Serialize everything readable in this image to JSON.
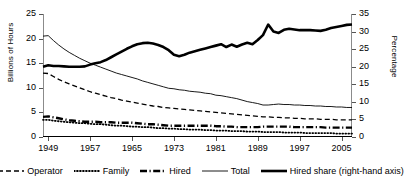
{
  "chart_data": {
    "type": "line",
    "title": "",
    "xlabel": "",
    "ylabel": "Billions of Hours",
    "y2label": "Percentage",
    "xlim": [
      1948,
      2007
    ],
    "ylim": [
      0,
      25
    ],
    "y2lim": [
      0,
      35
    ],
    "grid": false,
    "legend_position": "bottom",
    "x_ticks": [
      "1949",
      "1957",
      "1965",
      "1973",
      "1981",
      "1989",
      "1997",
      "2005"
    ],
    "x_tick_values": [
      1949,
      1957,
      1965,
      1973,
      1981,
      1989,
      1997,
      2005
    ],
    "y_ticks": [
      "0",
      "5",
      "10",
      "15",
      "20",
      "25"
    ],
    "y_tick_values": [
      0,
      5,
      10,
      15,
      20,
      25
    ],
    "y2_ticks": [
      "0",
      "5",
      "10",
      "15",
      "20",
      "25",
      "30",
      "35"
    ],
    "y2_tick_values": [
      0,
      5,
      10,
      15,
      20,
      25,
      30,
      35
    ],
    "x": [
      1948,
      1949,
      1950,
      1951,
      1952,
      1953,
      1954,
      1955,
      1956,
      1957,
      1958,
      1959,
      1960,
      1961,
      1962,
      1963,
      1964,
      1965,
      1966,
      1967,
      1968,
      1969,
      1970,
      1971,
      1972,
      1973,
      1974,
      1975,
      1976,
      1977,
      1978,
      1979,
      1980,
      1981,
      1982,
      1983,
      1984,
      1985,
      1986,
      1987,
      1988,
      1989,
      1990,
      1991,
      1992,
      1993,
      1994,
      1995,
      1996,
      1997,
      1998,
      1999,
      2000,
      2001,
      2002,
      2003,
      2004,
      2005,
      2006,
      2007
    ],
    "series": [
      {
        "name": "Operator",
        "axis": "left",
        "style": "dashed",
        "values": [
          13.0,
          12.9,
          12.3,
          11.7,
          11.2,
          10.8,
          10.4,
          10.0,
          9.6,
          9.2,
          8.9,
          8.6,
          8.3,
          8.0,
          7.8,
          7.5,
          7.3,
          7.1,
          6.9,
          6.7,
          6.5,
          6.3,
          6.2,
          6.0,
          5.9,
          5.8,
          5.7,
          5.6,
          5.5,
          5.4,
          5.3,
          5.2,
          5.1,
          5.0,
          4.9,
          4.8,
          4.7,
          4.6,
          4.5,
          4.4,
          4.3,
          4.2,
          4.1,
          4.1,
          4.0,
          4.0,
          3.9,
          3.9,
          3.8,
          3.8,
          3.7,
          3.7,
          3.7,
          3.6,
          3.6,
          3.6,
          3.5,
          3.5,
          3.5,
          3.5
        ]
      },
      {
        "name": "Family",
        "axis": "left",
        "style": "dotted",
        "values": [
          3.5,
          3.5,
          3.3,
          3.2,
          3.1,
          3.0,
          2.9,
          2.8,
          2.8,
          2.7,
          2.6,
          2.6,
          2.5,
          2.4,
          2.3,
          2.3,
          2.2,
          2.1,
          2.1,
          2.0,
          2.0,
          1.9,
          1.8,
          1.8,
          1.7,
          1.7,
          1.6,
          1.6,
          1.5,
          1.5,
          1.5,
          1.4,
          1.4,
          1.3,
          1.3,
          1.3,
          1.2,
          1.2,
          1.2,
          1.1,
          1.1,
          1.1,
          1.0,
          1.0,
          1.0,
          1.0,
          0.9,
          0.9,
          0.9,
          0.9,
          0.8,
          0.8,
          0.8,
          0.8,
          0.8,
          0.8,
          0.7,
          0.7,
          0.7,
          0.7
        ]
      },
      {
        "name": "Hired",
        "axis": "left",
        "style": "thick-dash-dot",
        "values": [
          4.1,
          4.2,
          4.0,
          3.8,
          3.6,
          3.4,
          3.3,
          3.2,
          3.1,
          3.1,
          3.1,
          3.0,
          3.0,
          3.0,
          2.9,
          2.9,
          2.9,
          2.9,
          2.8,
          2.7,
          2.6,
          2.6,
          2.5,
          2.4,
          2.3,
          2.3,
          2.3,
          2.3,
          2.3,
          2.3,
          2.3,
          2.3,
          2.3,
          2.2,
          2.2,
          2.1,
          2.1,
          2.0,
          2.0,
          2.0,
          2.0,
          2.0,
          2.1,
          2.1,
          2.1,
          2.1,
          2.1,
          2.1,
          2.0,
          2.0,
          2.0,
          2.0,
          2.0,
          2.0,
          1.9,
          1.9,
          1.9,
          1.9,
          1.9,
          1.9
        ]
      },
      {
        "name": "Total",
        "axis": "left",
        "style": "thin-solid",
        "values": [
          20.5,
          20.6,
          19.6,
          18.7,
          17.9,
          17.2,
          16.6,
          16.0,
          15.5,
          15.0,
          14.6,
          14.2,
          13.8,
          13.4,
          13.0,
          12.7,
          12.4,
          12.1,
          11.8,
          11.4,
          11.1,
          10.8,
          10.5,
          10.2,
          9.9,
          9.8,
          9.6,
          9.5,
          9.3,
          9.2,
          9.1,
          8.9,
          8.8,
          8.5,
          8.4,
          8.2,
          8.0,
          7.8,
          7.5,
          7.2,
          7.0,
          6.8,
          6.5,
          6.5,
          6.6,
          6.7,
          6.6,
          6.6,
          6.5,
          6.5,
          6.4,
          6.4,
          6.3,
          6.3,
          6.2,
          6.2,
          6.1,
          6.1,
          6.0,
          6.0
        ]
      },
      {
        "name": "Hired share (right-hand axis)",
        "axis": "right",
        "style": "thick-solid",
        "values": [
          20.0,
          20.4,
          20.2,
          20.2,
          20.1,
          20.0,
          20.0,
          20.0,
          20.1,
          20.6,
          21.0,
          21.3,
          21.9,
          22.7,
          23.5,
          24.3,
          25.1,
          25.8,
          26.4,
          26.7,
          26.8,
          26.6,
          26.2,
          25.6,
          24.7,
          23.4,
          23.0,
          23.4,
          24.0,
          24.4,
          24.8,
          25.2,
          25.6,
          26.0,
          26.4,
          25.6,
          26.3,
          25.7,
          26.3,
          26.8,
          26.4,
          27.6,
          29.0,
          32.0,
          30.0,
          29.6,
          30.5,
          30.8,
          30.6,
          30.4,
          30.4,
          30.4,
          30.3,
          30.2,
          30.5,
          31.0,
          31.3,
          31.6,
          31.9,
          32.0
        ]
      }
    ]
  },
  "legend": {
    "items": [
      {
        "label": "Operator",
        "swatch": "dashed-line-swatch"
      },
      {
        "label": "Family",
        "swatch": "dotted-line-swatch"
      },
      {
        "label": "Hired",
        "swatch": "thick-dash-dot-line-swatch"
      },
      {
        "label": "Total",
        "swatch": "thin-solid-line-swatch"
      },
      {
        "label": "Hired share (right-hand axis)",
        "swatch": "thick-solid-line-swatch"
      }
    ]
  }
}
